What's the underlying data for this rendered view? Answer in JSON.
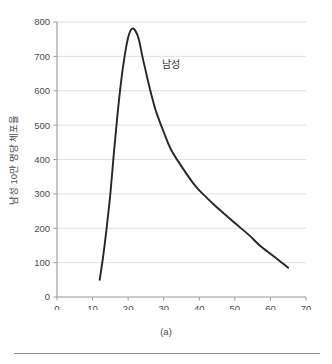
{
  "figure": {
    "caption": "(a)",
    "annotation": "남성"
  },
  "chart_data": {
    "type": "line",
    "title": "",
    "xlabel": "연령",
    "ylabel": "남성 10만 명당 체포율",
    "xlim": [
      0,
      70
    ],
    "ylim": [
      0,
      800
    ],
    "grid": "horizontal",
    "legend": "none",
    "xticks": [
      0,
      10,
      20,
      30,
      40,
      50,
      60,
      70
    ],
    "yticks": [
      0,
      100,
      200,
      300,
      400,
      500,
      600,
      700,
      800
    ],
    "series": [
      {
        "name": "남성",
        "color": "#262626",
        "x": [
          12,
          13,
          14,
          15,
          16,
          17,
          18,
          19,
          20,
          21,
          22,
          23,
          24,
          25,
          26,
          27,
          28,
          30,
          32,
          35,
          38,
          40,
          42,
          44,
          47,
          50,
          54,
          57,
          61,
          65
        ],
        "values": [
          50,
          120,
          205,
          300,
          420,
          530,
          625,
          700,
          755,
          780,
          775,
          750,
          700,
          655,
          610,
          570,
          535,
          480,
          430,
          380,
          335,
          310,
          290,
          270,
          242,
          215,
          180,
          150,
          118,
          85
        ]
      }
    ],
    "annotations": [
      {
        "text": "남성",
        "x": 32,
        "y": 665
      }
    ]
  }
}
